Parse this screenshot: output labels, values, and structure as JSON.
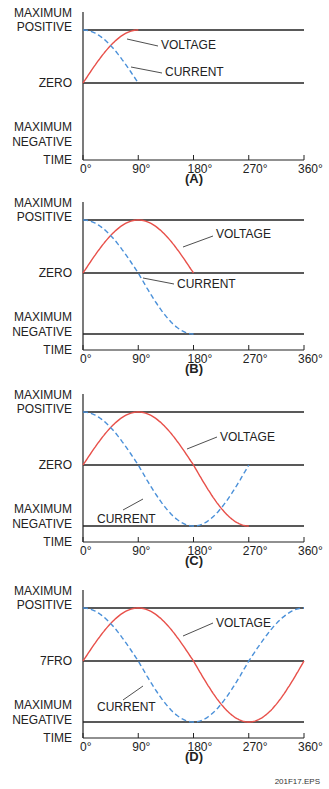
{
  "figure_id": "201F17.EPS",
  "y_labels": {
    "max_positive": [
      "MAXIMUM",
      "POSITIVE"
    ],
    "zero": "ZERO",
    "zero_panel_d": "7FRO",
    "max_negative": [
      "MAXIMUM",
      "NEGATIVE"
    ],
    "time": "TIME"
  },
  "x_ticks": [
    "0°",
    "90°",
    "180°",
    "270°",
    "360°"
  ],
  "series_labels": {
    "voltage": "VOLTAGE",
    "current": "CURRENT"
  },
  "colors": {
    "voltage": "#e8504a",
    "current": "#4a90d9",
    "axis": "#222222"
  },
  "panels": [
    {
      "caption": "(A)",
      "extent_deg": 90
    },
    {
      "caption": "(B)",
      "extent_deg": 180
    },
    {
      "caption": "(C)",
      "extent_deg": 270
    },
    {
      "caption": "(D)",
      "extent_deg": 360
    }
  ],
  "chart_data": {
    "type": "line",
    "xlabel": "TIME",
    "x_ticks": [
      "0°",
      "90°",
      "180°",
      "270°",
      "360°"
    ],
    "series": [
      {
        "name": "VOLTAGE",
        "function": "sin(θ)",
        "style": "solid red"
      },
      {
        "name": "CURRENT",
        "function": "cos(θ)",
        "style": "dashed blue"
      }
    ]
  }
}
